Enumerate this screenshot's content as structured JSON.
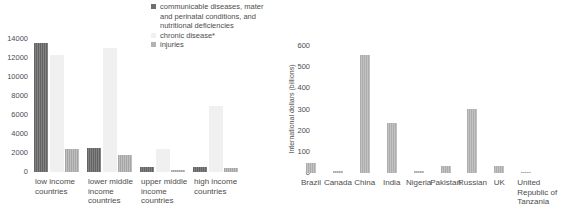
{
  "legend": {
    "items": [
      {
        "label": "communicable diseases, mater and perinatal conditions, and nutritional deficiencies",
        "color": "#6f6f6f"
      },
      {
        "label": "chronic disease*",
        "color": "#f1f0f0"
      },
      {
        "label": "injuries",
        "color": "#b2b2b2"
      }
    ]
  },
  "chart_data": [
    {
      "id": "deaths-by-income-group",
      "type": "bar",
      "categories": [
        "low income countries",
        "lower middle income countries",
        "upper middle income countries",
        "high income countries"
      ],
      "series": [
        {
          "name": "communicable diseases, mater and perinatal conditions, and nutritional deficiencies",
          "key": "communicable",
          "color": "#6f6f6f",
          "values": [
            13600,
            2500,
            550,
            500
          ]
        },
        {
          "name": "chronic disease*",
          "key": "chronic",
          "color": "#f1f0f0",
          "values": [
            12300,
            13100,
            2400,
            6900
          ]
        },
        {
          "name": "injuries",
          "key": "injuries",
          "color": "#b2b2b2",
          "values": [
            2400,
            1800,
            250,
            400
          ]
        }
      ],
      "title": "",
      "xlabel": "",
      "ylabel": "",
      "ylim": [
        0,
        14000
      ],
      "yticks": [
        0,
        2000,
        4000,
        6000,
        8000,
        10000,
        12000,
        14000
      ],
      "grid": false,
      "legend_position": "top-right"
    },
    {
      "id": "income-loss-by-country",
      "type": "bar",
      "categories": [
        "Brazil",
        "Canada",
        "China",
        "India",
        "Nigeria",
        "Pakistan",
        "Russian",
        "UK",
        "United Republic of Tanzania"
      ],
      "values": [
        49,
        9,
        558,
        237,
        8,
        31,
        303,
        33,
        3
      ],
      "bar_color": "#b8b8b8",
      "title": "",
      "xlabel": "",
      "ylabel": "International dollars (billions)",
      "ylim": [
        0,
        600
      ],
      "yticks": [
        0,
        100,
        200,
        300,
        400,
        500,
        600
      ],
      "grid": false,
      "legend_position": "none"
    }
  ]
}
